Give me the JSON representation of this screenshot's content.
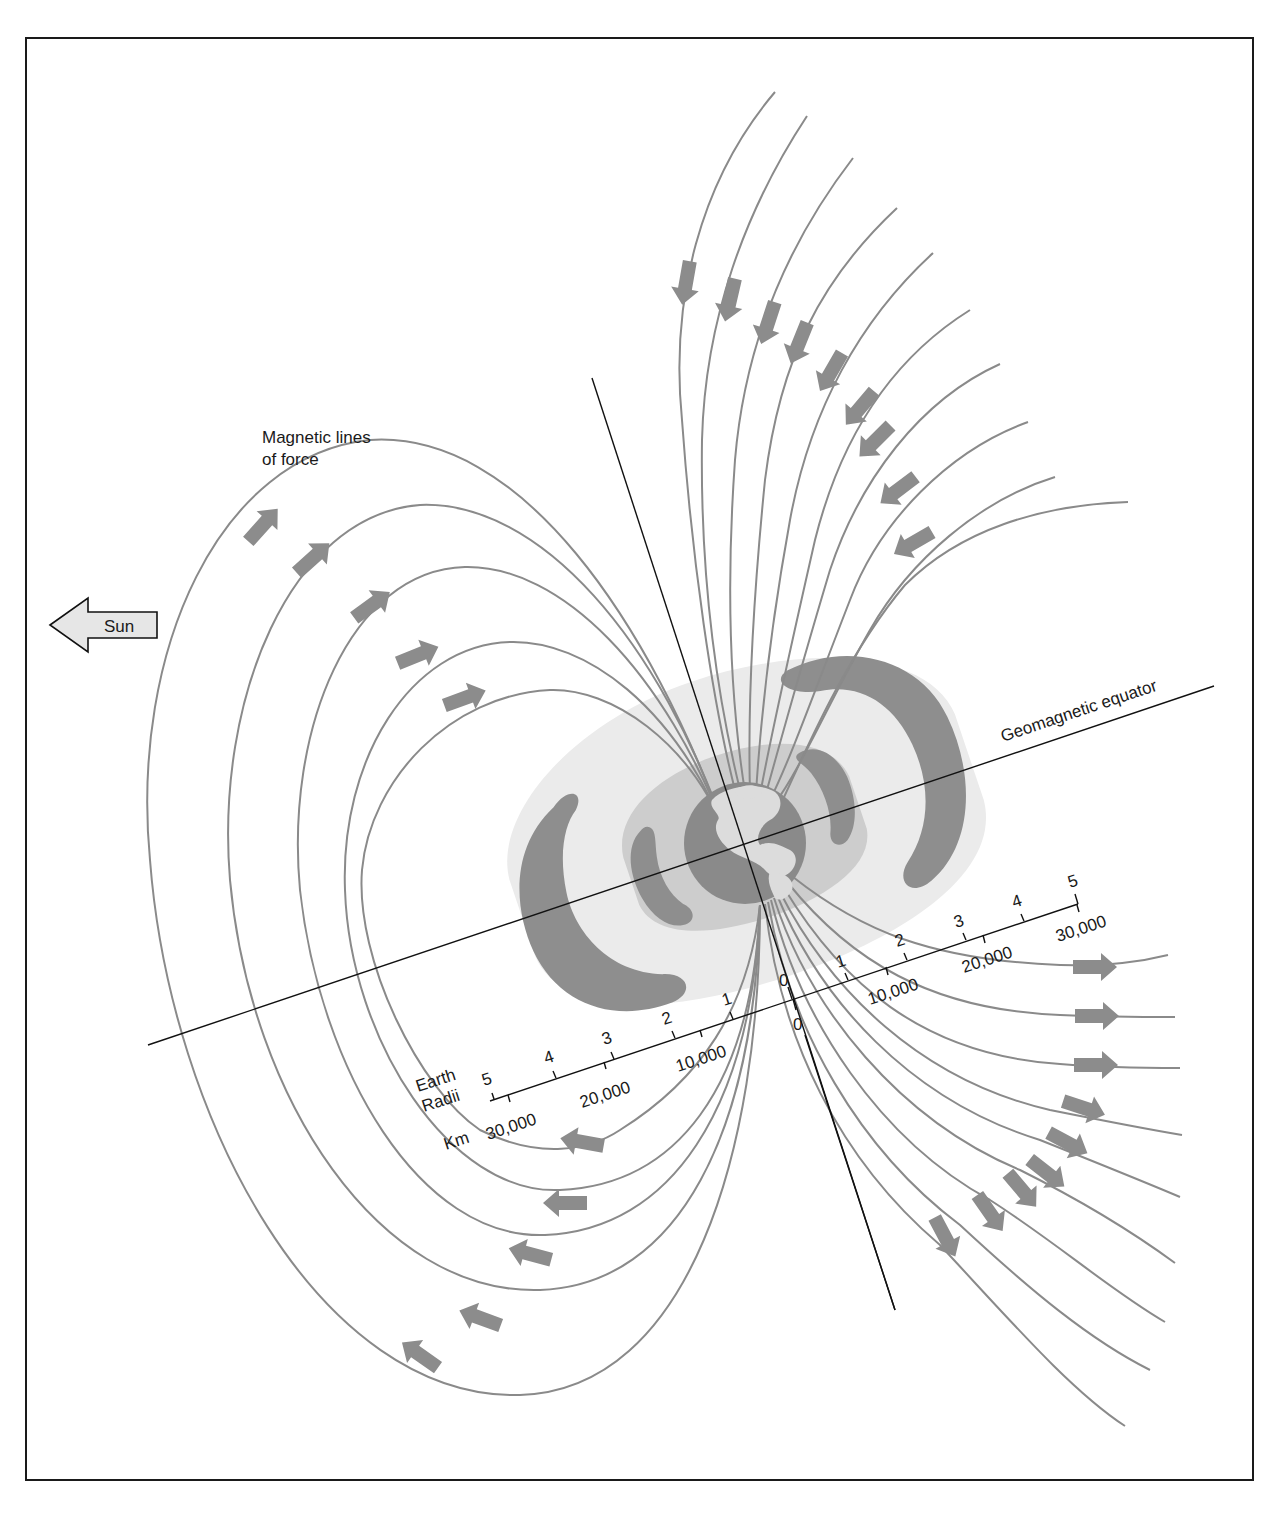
{
  "figure": {
    "title_label": {
      "line1": "Magnetic lines",
      "line2": "of force"
    },
    "sun_label": "Sun",
    "equator_label": "Geomagnetic equator",
    "colors": {
      "field_line": "#8a8a8a",
      "arrow": "#8c8c8c",
      "belt_inner_dark": "#8e8e8e",
      "belt_outer_dark": "#8e8e8e",
      "belt_halo": "#e9e9e9",
      "belt_inner_halo": "#cfcfcf",
      "earth_ocean": "#8a8a8a",
      "earth_land": "#dcdcdc",
      "axis": "#111111",
      "frame": "#1a1a1a"
    }
  },
  "scales": {
    "left": {
      "radii_title_1": "Earth",
      "radii_title_2": "Radii",
      "km_title": "Km",
      "radii_ticks": [
        "5",
        "4",
        "3",
        "2",
        "1",
        "0"
      ],
      "km_ticks": [
        "30,000",
        "20,000",
        "10,000",
        "0"
      ]
    },
    "right": {
      "radii_ticks": [
        "1",
        "2",
        "3",
        "4",
        "5"
      ],
      "km_ticks": [
        "10,000",
        "20,000",
        "30,000"
      ]
    }
  },
  "field_lines": {
    "dayside_loops": 5,
    "northern_incoming": 10,
    "southern_outgoing": 10,
    "arrow_direction_dayside_upper": "toward north pole",
    "arrow_direction_dayside_lower": "away from south pole",
    "arrow_direction_nightside_upper": "inward",
    "arrow_direction_nightside_lower": "outward"
  },
  "radiation_belts": {
    "inner": "Inner belt",
    "outer": "Outer belt"
  }
}
